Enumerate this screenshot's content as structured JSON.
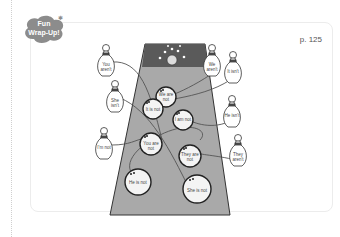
{
  "badge": {
    "line1": "Fun",
    "line2": "Wrap-Up!",
    "color": "#8c8c8c"
  },
  "page": {
    "number": "p. 125"
  },
  "lane": {
    "color": "#a9a9a9",
    "top_color": "#5a5a5a"
  },
  "balls": [
    {
      "text": "We are not",
      "x": 166,
      "y": 96
    },
    {
      "text": "It is not",
      "x": 153,
      "y": 108
    },
    {
      "text": "I am not",
      "x": 183,
      "y": 119
    },
    {
      "text": "You are not",
      "x": 150,
      "y": 143
    },
    {
      "text": "They are not",
      "x": 190,
      "y": 155
    },
    {
      "text": "He is not",
      "x": 138,
      "y": 183
    },
    {
      "text": "She is not",
      "x": 196,
      "y": 191
    }
  ],
  "pins": [
    {
      "text": "You aren't",
      "x": 107,
      "y": 66
    },
    {
      "text": "She isn't",
      "x": 115,
      "y": 101
    },
    {
      "text": "I'm not",
      "x": 105,
      "y": 149
    },
    {
      "text": "We aren't",
      "x": 212,
      "y": 68
    },
    {
      "text": "It isn't",
      "x": 233,
      "y": 74
    },
    {
      "text": "He isn't",
      "x": 232,
      "y": 117
    },
    {
      "text": "They aren't",
      "x": 240,
      "y": 156
    }
  ]
}
